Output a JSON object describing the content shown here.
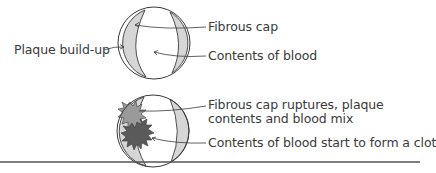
{
  "diagram": {
    "stage1": {
      "name": "artery-cross-section-intact",
      "labels": {
        "plaque": "Plaque build-up",
        "fibrous_cap": "Fibrous cap",
        "blood": "Contents of blood"
      }
    },
    "stage2": {
      "name": "artery-cross-section-ruptured",
      "labels": {
        "rupture_line1": "Fibrous cap ruptures, plaque",
        "rupture_line2": "contents and blood mix",
        "clot": "Contents of blood start to form a clot"
      }
    },
    "colors": {
      "outline": "#3a3a3a",
      "plaque_fill": "#d6d6d6",
      "light_burst": "#9a9a9a",
      "dark_burst": "#5a5a5a",
      "rule": "#555555"
    }
  }
}
